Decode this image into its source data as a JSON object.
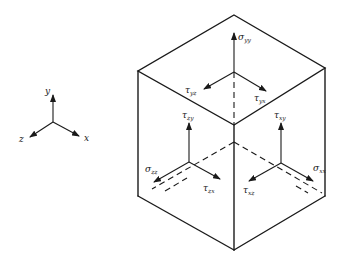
{
  "diagram": {
    "axes": {
      "x_label": "x",
      "y_label": "y",
      "z_label": "z"
    },
    "top_face": {
      "normal": {
        "symbol": "σ",
        "subscript": "yy"
      },
      "shear_1": {
        "symbol": "τ",
        "subscript": "yz"
      },
      "shear_2": {
        "symbol": "τ",
        "subscript": "yx"
      }
    },
    "left_face": {
      "normal": {
        "symbol": "σ",
        "subscript": "zz"
      },
      "shear_1": {
        "symbol": "τ",
        "subscript": "zy"
      },
      "shear_2": {
        "symbol": "τ",
        "subscript": "zx"
      }
    },
    "right_face": {
      "normal": {
        "symbol": "σ",
        "subscript": "xx"
      },
      "shear_1": {
        "symbol": "τ",
        "subscript": "xy"
      },
      "shear_2": {
        "symbol": "τ",
        "subscript": "xz"
      }
    },
    "colors": {
      "line": "#1a1a1a",
      "background": "#ffffff"
    }
  }
}
